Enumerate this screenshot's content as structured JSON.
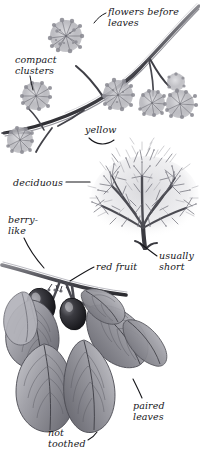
{
  "illustration": {
    "subject": "flowering shrub with red fruit",
    "style": "grayscale pencil field-guide plate",
    "background_color": "#ffffff",
    "ink_color": "#16161a",
    "tone_color": "#9a9a9e",
    "fruit_color": "#2a2a2e"
  },
  "labels": [
    {
      "id": "flowers-before-leaves",
      "text": "flowers before\nleaves",
      "x": 108,
      "y": 7
    },
    {
      "id": "compact-clusters",
      "text": "compact\nclusters",
      "x": 15,
      "y": 55
    },
    {
      "id": "yellow",
      "text": "yellow",
      "x": 85,
      "y": 125
    },
    {
      "id": "deciduous",
      "text": "deciduous",
      "x": 13,
      "y": 178
    },
    {
      "id": "berry-like",
      "text": "berry-\nlike",
      "x": 8,
      "y": 215
    },
    {
      "id": "red-fruit",
      "text": "red fruit",
      "x": 96,
      "y": 262
    },
    {
      "id": "usually-short",
      "text": "usually\nshort",
      "x": 159,
      "y": 251
    },
    {
      "id": "paired-leaves",
      "text": "paired\nleaves",
      "x": 133,
      "y": 401
    },
    {
      "id": "not-toothed",
      "text": "not\ntoothed",
      "x": 48,
      "y": 428
    }
  ],
  "parts": [
    {
      "id": "flowering-branch",
      "name": "flowering branch with compact clusters"
    },
    {
      "id": "shrub-habit",
      "name": "bare twiggy shrub silhouette"
    },
    {
      "id": "fruiting-branch",
      "name": "branch with paired leaves and red fruit"
    }
  ]
}
